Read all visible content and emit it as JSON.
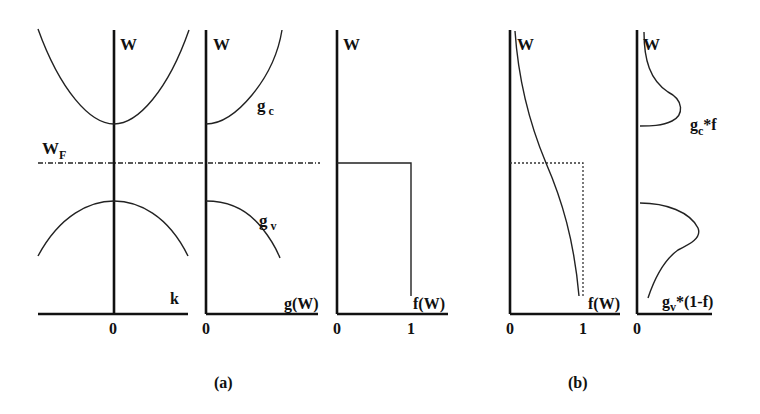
{
  "figure": {
    "panel_a": {
      "caption": "(a)",
      "band_structure": {
        "y_axis_label": "W",
        "x_axis_label": "k",
        "origin_tick": "0",
        "fermi_label_main": "W",
        "fermi_label_sub": "F"
      },
      "density_of_states": {
        "y_axis_label": "W",
        "x_axis_label": "g(W)",
        "origin_tick": "0",
        "conduction_label_main": "g",
        "conduction_label_sub": "c",
        "valence_label_main": "g",
        "valence_label_sub": "v"
      },
      "fermi_function_T0": {
        "y_axis_label": "W",
        "x_axis_label": "f(W)",
        "tick_0": "0",
        "tick_1": "1"
      }
    },
    "panel_b": {
      "caption": "(b)",
      "fermi_function_T": {
        "y_axis_label": "W",
        "x_axis_label": "f(W)",
        "tick_0": "0",
        "tick_1": "1"
      },
      "carrier_distribution": {
        "y_axis_label": "W",
        "origin_tick": "0",
        "electron_label_main": "g",
        "electron_label_sub": "c",
        "electron_label_suffix": "*f",
        "hole_label_main": "g",
        "hole_label_sub": "v",
        "hole_label_suffix": "*(1-f)"
      }
    },
    "colors": {
      "ink": "#111111",
      "background": "#ffffff"
    }
  }
}
